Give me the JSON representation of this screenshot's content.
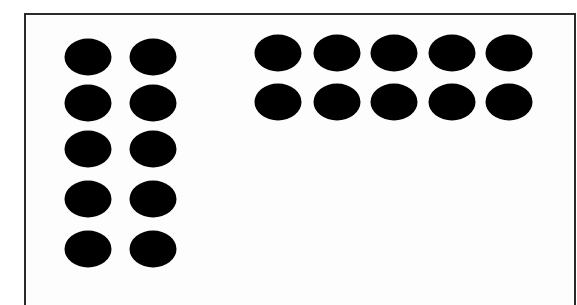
{
  "diagram": {
    "dot_color": "#000000",
    "frame_color": "#2a2a2a",
    "background_color": "#ffffff",
    "groups": [
      {
        "name": "left-group",
        "rows": 5,
        "columns": 2,
        "count": 10,
        "column_centers_x": [
          88,
          153
        ],
        "row_centers_y": [
          57,
          103,
          149,
          199,
          249
        ]
      },
      {
        "name": "right-group",
        "rows": 2,
        "columns": 5,
        "count": 10,
        "column_centers_x": [
          278,
          337,
          394,
          452,
          509
        ],
        "row_centers_y": [
          53,
          102
        ]
      }
    ],
    "total_dots": 20
  }
}
